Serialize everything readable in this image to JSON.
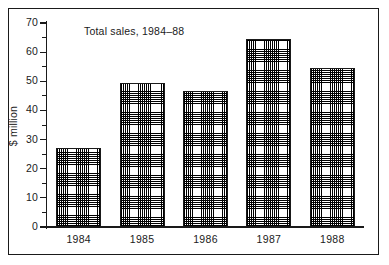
{
  "chart_data": {
    "type": "bar",
    "title": "Total sales, 1984–88",
    "xlabel": "",
    "ylabel": "$ million",
    "categories": [
      "1984",
      "1985",
      "1986",
      "1987",
      "1988"
    ],
    "values": [
      27,
      49.5,
      46.5,
      64.5,
      54.5
    ],
    "ylim": [
      0,
      70
    ],
    "ytick_values": [
      0,
      10,
      20,
      30,
      40,
      50,
      60,
      70
    ],
    "ytick_labels": [
      "0",
      "10",
      "20",
      "30",
      "40",
      "50",
      "60",
      "70"
    ],
    "yminor_values": [
      5,
      15,
      25,
      35,
      45,
      55,
      65
    ],
    "grid": false,
    "legend": null,
    "legend_position": "none",
    "bar_fill": "#ffffff",
    "bar_pattern": "cross-hatch-dot-stipple",
    "bar_edge_color": "#1a1a1a",
    "axis_color": "#1a1a1a",
    "frame_color": "#1a1a1a",
    "background": "#ffffff"
  }
}
